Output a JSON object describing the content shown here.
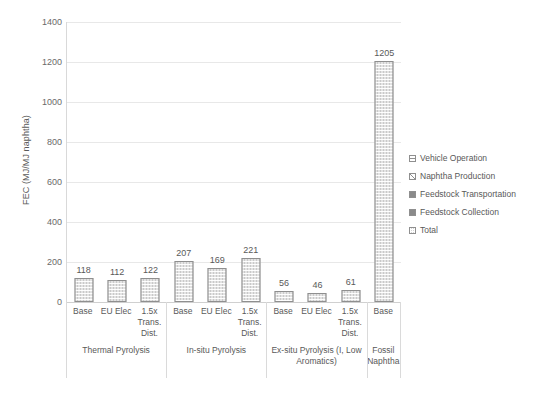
{
  "chart_data": {
    "type": "bar",
    "title": "",
    "xlabel": "",
    "ylabel": "FEC (MJ/MJ naphtha)",
    "ylim": [
      0,
      1400
    ],
    "ytick_step": 200,
    "yticks": [
      0,
      200,
      400,
      600,
      800,
      1000,
      1200,
      1400
    ],
    "ytick_labels": [
      "0",
      "200",
      "400",
      "600",
      "800",
      "1000",
      "1200",
      "1400"
    ],
    "grid": true,
    "legend_position": "right",
    "categories": [
      "Base",
      "EU Elec",
      "1.5x Trans. Dist.",
      "Base",
      "EU Elec",
      "1.5x Trans. Dist.",
      "Base",
      "EU Elec",
      "1.5x Trans. Dist.",
      "Base"
    ],
    "values": [
      118,
      112,
      122,
      207,
      169,
      221,
      56,
      46,
      61,
      1205
    ],
    "data_labels": [
      "118",
      "112",
      "122",
      "207",
      "169",
      "221",
      "56",
      "46",
      "61",
      "1205"
    ],
    "groups": [
      {
        "label": "Thermal Pyrolysis",
        "span": 3
      },
      {
        "label": "In-situ Pyrolysis",
        "span": 3
      },
      {
        "label": "Ex-situ Pyrolysis (I, Low Aromatics)",
        "span": 3
      },
      {
        "label": "Fossil Naphtha",
        "span": 1
      }
    ],
    "series": [
      {
        "name": "Total",
        "values": [
          118,
          112,
          122,
          207,
          169,
          221,
          56,
          46,
          61,
          1205
        ]
      }
    ],
    "legend": [
      {
        "label": "Vehicle Operation",
        "swatch": "sw-vehicle"
      },
      {
        "label": "Naphtha Production",
        "swatch": "sw-naphtha"
      },
      {
        "label": "Feedstock Transportation",
        "swatch": "sw-solid"
      },
      {
        "label": "Feedstock Collection",
        "swatch": "sw-solid"
      },
      {
        "label": "Total",
        "swatch": "sw-total"
      }
    ],
    "colors": {
      "bar_fill": "#c9c9c9",
      "bar_border": "#8f8f8f",
      "gridline": "#e8e8e8",
      "text": "#595959",
      "background": "#ffffff"
    }
  }
}
